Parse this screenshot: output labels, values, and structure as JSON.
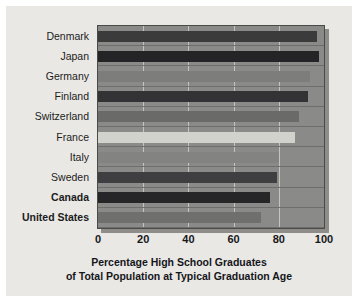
{
  "chart_data": {
    "type": "bar",
    "orientation": "horizontal",
    "title": "",
    "xlabel": "Percentage High School Graduates of Total Population at Typical Graduation Age",
    "xlabel_lines": [
      "Percentage High School Graduates",
      "of Total Population at Typical Graduation Age"
    ],
    "ylabel": "",
    "xlim": [
      0,
      100
    ],
    "xticks": [
      0,
      20,
      40,
      60,
      80,
      100
    ],
    "xtick_labels": [
      "0",
      "20",
      "40",
      "60",
      "80",
      "100"
    ],
    "grid": true,
    "legend": null,
    "categories": [
      "Denmark",
      "Japan",
      "Germany",
      "Finland",
      "Switzerland",
      "France",
      "Italy",
      "Sweden",
      "Canada",
      "United States"
    ],
    "values": [
      97,
      98,
      94,
      93,
      89,
      87,
      80,
      79,
      76,
      72
    ],
    "bars": [
      {
        "category": "Denmark",
        "value": 97,
        "color": "#3b3b3c",
        "emphasis": false
      },
      {
        "category": "Japan",
        "value": 98,
        "color": "#242426",
        "emphasis": false
      },
      {
        "category": "Germany",
        "value": 94,
        "color": "#7d7d7b",
        "emphasis": false
      },
      {
        "category": "Finland",
        "value": 93,
        "color": "#333335",
        "emphasis": false
      },
      {
        "category": "Switzerland",
        "value": 89,
        "color": "#6a6a69",
        "emphasis": false
      },
      {
        "category": "France",
        "value": 87,
        "color": "#d2d2cd",
        "emphasis": false
      },
      {
        "category": "Italy",
        "value": 80,
        "color": "#838382",
        "emphasis": false
      },
      {
        "category": "Sweden",
        "value": 79,
        "color": "#3f3f41",
        "emphasis": false
      },
      {
        "category": "Canada",
        "value": 76,
        "color": "#262628",
        "emphasis": true
      },
      {
        "category": "United States",
        "value": 72,
        "color": "#6f6f6e",
        "emphasis": true
      }
    ]
  },
  "style": {
    "panel_background": "#8a8a88",
    "paper_background": "#e9e8e4",
    "gridline_color": "#d8d8d2",
    "axis_color": "#4a4a49",
    "text_color": "#1c1c1c"
  }
}
